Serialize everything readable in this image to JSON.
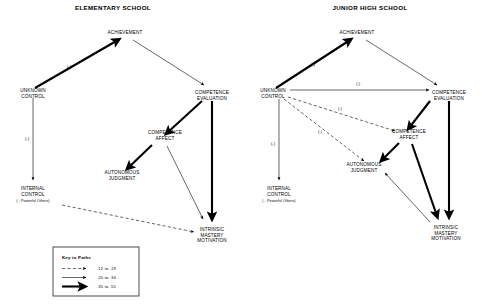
{
  "figure": {
    "type": "path-diagram",
    "panels": [
      {
        "id": "elementary",
        "title": "ELEMENTARY SCHOOL",
        "nodes": {
          "achievement": {
            "label": "ACHIEVEMENT"
          },
          "unknown_control": {
            "line1": "UNKNOWN",
            "line2": "CONTROL"
          },
          "competence_evaluation": {
            "line1": "COMPETENCE",
            "line2": "EVALUATION"
          },
          "competence_affect": {
            "line1": "COMPETENCE",
            "line2": "AFFECT"
          },
          "autonomous_judgment": {
            "line1": "AUTONOMOUS",
            "line2": "JUDGMENT"
          },
          "internal_control": {
            "line1": "INTERNAL",
            "line2": "CONTROL",
            "sub": "( - Powerful Others)"
          },
          "intrinsic_mastery": {
            "line1": "INTRINSIC",
            "line2": "MASTERY",
            "line3": "MOTIVATION"
          }
        },
        "edge_signs": {
          "unknown_to_achievement": "(-)",
          "unknown_to_internal": "(-)"
        }
      },
      {
        "id": "junior_high",
        "title": "JUNIOR HIGH SCHOOL",
        "nodes": {
          "achievement": {
            "label": "ACHIEVEMENT"
          },
          "unknown_control": {
            "line1": "UNKNOWN",
            "line2": "CONTROL"
          },
          "competence_evaluation": {
            "line1": "COMPETENCE",
            "line2": "EVALUATION"
          },
          "competence_affect": {
            "line1": "COMPETENCE",
            "line2": "AFFECT"
          },
          "autonomous_judgment": {
            "line1": "AUTONOMOUS",
            "line2": "JUDGMENT"
          },
          "internal_control": {
            "line1": "INTERNAL",
            "line2": "CONTROL",
            "sub": "( - Powerful Others)"
          },
          "intrinsic_mastery": {
            "line1": "INTRINSIC",
            "line2": "MASTERY",
            "line3": "MOTIVATION"
          }
        },
        "edge_signs": {
          "unknown_to_achievement": "(-)",
          "unknown_to_competence_evaluation": "(-)",
          "unknown_to_competence_affect": "(-)",
          "unknown_to_autonomous_judgment": "(-)",
          "unknown_to_internal": "(-)"
        }
      }
    ],
    "legend": {
      "title": "Key to Paths",
      "entries": [
        {
          "style": "dashed",
          "range": ".12 to .19"
        },
        {
          "style": "thin",
          "range": ".20 to .34"
        },
        {
          "style": "thick",
          "range": ".35 to .55"
        }
      ]
    },
    "colors": {
      "ink": "#000000",
      "background": "#ffffff"
    }
  }
}
